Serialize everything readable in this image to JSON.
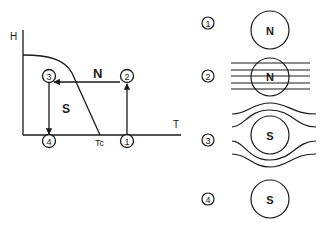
{
  "phase_diagram": {
    "y_axis_label": "H",
    "x_axis_label": "T",
    "critical_temp_label": "Tc",
    "normal_region_label": "N",
    "superconducting_region_label": "S",
    "points": [
      {
        "id": "1",
        "label": "1"
      },
      {
        "id": "2",
        "label": "2"
      },
      {
        "id": "3",
        "label": "3"
      },
      {
        "id": "4",
        "label": "4"
      }
    ]
  },
  "states": [
    {
      "label": "1",
      "phase": "N",
      "field": "none"
    },
    {
      "label": "2",
      "phase": "N",
      "field": "penetrating"
    },
    {
      "label": "3",
      "phase": "S",
      "field": "expelled"
    },
    {
      "label": "4",
      "phase": "S",
      "field": "none"
    }
  ],
  "colors": {
    "ink": "#1a1a1a",
    "background": "#ffffff"
  }
}
